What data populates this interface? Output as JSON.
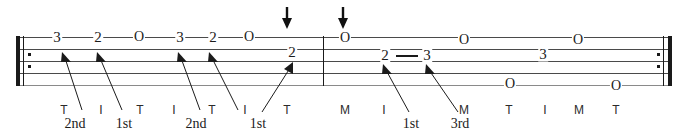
{
  "document": {
    "title": "Banjo Tablature Exercise",
    "kind": "tablature-staff"
  },
  "staff": {
    "line_count": 5,
    "top_y": 37,
    "line_spacing": 12,
    "left_x": 16,
    "right_x": 672,
    "color": "#4a4a4a"
  },
  "barlines": {
    "open_repeat_label": "open-repeat",
    "middle_label": "measure-divider",
    "close_repeat_label": "close-repeat"
  },
  "arrows": {
    "label": "down-arrow",
    "positions": [
      287,
      343
    ]
  },
  "measure1": {
    "notes": [
      {
        "text": "3",
        "x": 57,
        "string": 1
      },
      {
        "text": "2",
        "x": 98,
        "string": 1
      },
      {
        "text": "O",
        "x": 139,
        "string": 1
      },
      {
        "text": "3",
        "x": 180,
        "string": 1
      },
      {
        "text": "2",
        "x": 213,
        "string": 1
      },
      {
        "text": "O",
        "x": 249,
        "string": 1
      },
      {
        "text": "2",
        "x": 292,
        "string": 2
      }
    ],
    "fingers": [
      {
        "text": "T",
        "x": 64
      },
      {
        "text": "I",
        "x": 101
      },
      {
        "text": "T",
        "x": 140
      },
      {
        "text": "I",
        "x": 174
      },
      {
        "text": "T",
        "x": 212
      },
      {
        "text": "I",
        "x": 245
      },
      {
        "text": "T",
        "x": 287
      }
    ],
    "callouts": [
      {
        "text": "2nd",
        "x": 75,
        "y": 124
      },
      {
        "text": "1st",
        "x": 124,
        "y": 124
      },
      {
        "text": "2nd",
        "x": 196,
        "y": 124
      },
      {
        "text": "1st",
        "x": 258,
        "y": 124
      }
    ]
  },
  "measure2": {
    "notes": [
      {
        "text": "O",
        "x": 345,
        "string": 1
      },
      {
        "text": "2",
        "x": 385,
        "string": 2
      },
      {
        "text": "3",
        "x": 427,
        "string": 2
      },
      {
        "text": "O",
        "x": 464,
        "string": 1
      },
      {
        "text": "O",
        "x": 510,
        "string": 5
      },
      {
        "text": "3",
        "x": 543,
        "string": 2
      },
      {
        "text": "O",
        "x": 578,
        "string": 1
      },
      {
        "text": "O",
        "x": 616,
        "string": 5
      }
    ],
    "tie": {
      "x": 396,
      "y": 56,
      "width": 22
    },
    "fingers": [
      {
        "text": "M",
        "x": 345
      },
      {
        "text": "I",
        "x": 384
      },
      {
        "text": "M",
        "x": 464
      },
      {
        "text": "T",
        "x": 509
      },
      {
        "text": "I",
        "x": 545
      },
      {
        "text": "M",
        "x": 579
      },
      {
        "text": "T",
        "x": 616
      }
    ],
    "callouts": [
      {
        "text": "1st",
        "x": 411,
        "y": 124
      },
      {
        "text": "3rd",
        "x": 460,
        "y": 124
      }
    ]
  }
}
